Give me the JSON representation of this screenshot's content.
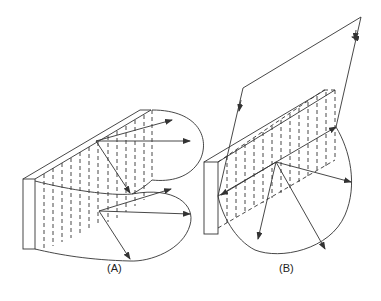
{
  "figure": {
    "panels": [
      {
        "id": "A",
        "label": "(A)",
        "label_pos": [
          107,
          269
        ]
      },
      {
        "id": "B",
        "label": "(B)",
        "label_pos": [
          279,
          269
        ]
      }
    ],
    "colors": {
      "stroke": "#333333",
      "background": "#ffffff"
    }
  }
}
